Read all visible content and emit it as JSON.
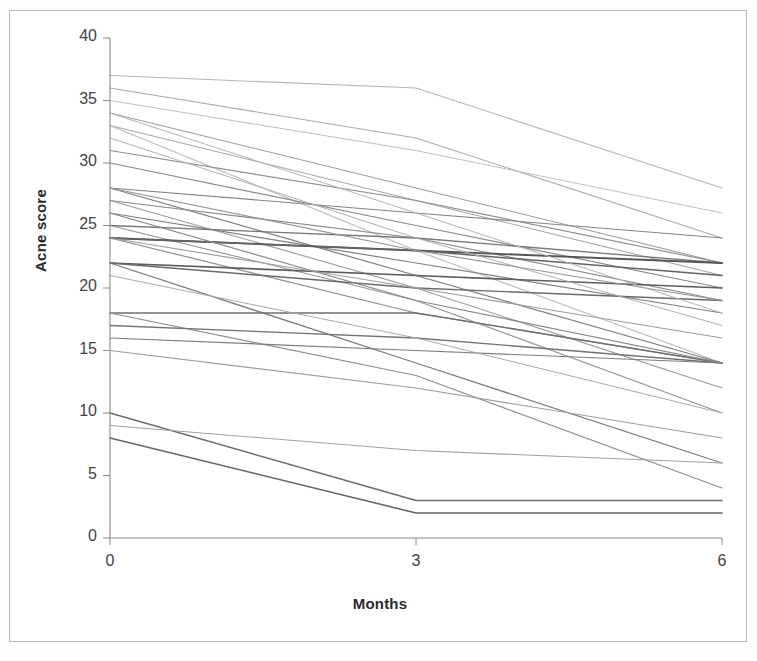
{
  "figure": {
    "background": "#ffffff",
    "frame_color": "#b9b9b9",
    "axis_color": "#8a8a8a"
  },
  "chart_data": {
    "type": "line",
    "title": "",
    "subtitle": "",
    "xlabel": "Months",
    "ylabel": "Acne score",
    "x": [
      0,
      3,
      6
    ],
    "xtick_labels": [
      "0",
      "3",
      "6"
    ],
    "ytick_labels": [
      "0",
      "5",
      "10",
      "15",
      "20",
      "25",
      "30",
      "35",
      "40"
    ],
    "xlim": [
      0,
      6
    ],
    "ylim": [
      0,
      40
    ],
    "ytick_step": 5,
    "grid": false,
    "legend": false,
    "legend_position": "none",
    "annotations": [],
    "line_color": "#6e6e6e",
    "series": [
      {
        "name": "patient-01",
        "values": [
          37,
          36,
          28
        ],
        "color": "#b5b5b5",
        "width": 1.1
      },
      {
        "name": "patient-02",
        "values": [
          36,
          32,
          24
        ],
        "color": "#ababab",
        "width": 1.1
      },
      {
        "name": "patient-03",
        "values": [
          34,
          28,
          22
        ],
        "color": "#9e9e9e",
        "width": 1.1
      },
      {
        "name": "patient-04",
        "values": [
          33,
          27,
          21
        ],
        "color": "#a6a6a6",
        "width": 1.1
      },
      {
        "name": "patient-05",
        "values": [
          33,
          23,
          14
        ],
        "color": "#bcbcbc",
        "width": 1.1
      },
      {
        "name": "patient-06",
        "values": [
          31,
          27,
          22
        ],
        "color": "#8f8f8f",
        "width": 1.2
      },
      {
        "name": "patient-07",
        "values": [
          30,
          25,
          20
        ],
        "color": "#8a8a8a",
        "width": 1.2
      },
      {
        "name": "patient-08",
        "values": [
          28,
          26,
          24
        ],
        "color": "#858585",
        "width": 1.2
      },
      {
        "name": "patient-09",
        "values": [
          28,
          21,
          14
        ],
        "color": "#7d7d7d",
        "width": 1.2
      },
      {
        "name": "patient-10",
        "values": [
          27,
          24,
          19
        ],
        "color": "#8b8b8b",
        "width": 1.2
      },
      {
        "name": "patient-11",
        "values": [
          27,
          20,
          12
        ],
        "color": "#9a9a9a",
        "width": 1.1
      },
      {
        "name": "patient-12",
        "values": [
          26,
          22,
          18
        ],
        "color": "#808080",
        "width": 1.2
      },
      {
        "name": "patient-13",
        "values": [
          25,
          24,
          22
        ],
        "color": "#777777",
        "width": 1.3
      },
      {
        "name": "patient-14",
        "values": [
          25,
          19,
          10
        ],
        "color": "#949494",
        "width": 1.1
      },
      {
        "name": "patient-15",
        "values": [
          24,
          23,
          22
        ],
        "color": "#555555",
        "width": 1.8
      },
      {
        "name": "patient-16",
        "values": [
          24,
          23,
          21
        ],
        "color": "#636363",
        "width": 1.5
      },
      {
        "name": "patient-17",
        "values": [
          24,
          18,
          14
        ],
        "color": "#8d8d8d",
        "width": 1.2
      },
      {
        "name": "patient-18",
        "values": [
          22,
          21,
          20
        ],
        "color": "#5c5c5c",
        "width": 1.7
      },
      {
        "name": "patient-19",
        "values": [
          22,
          20,
          19
        ],
        "color": "#6a6a6a",
        "width": 1.4
      },
      {
        "name": "patient-20",
        "values": [
          22,
          14,
          6
        ],
        "color": "#7a7a7a",
        "width": 1.3
      },
      {
        "name": "patient-21",
        "values": [
          18,
          18,
          14
        ],
        "color": "#6f6f6f",
        "width": 1.4
      },
      {
        "name": "patient-22",
        "values": [
          18,
          13,
          4
        ],
        "color": "#8e8e8e",
        "width": 1.2
      },
      {
        "name": "patient-23",
        "values": [
          17,
          16,
          14
        ],
        "color": "#737373",
        "width": 1.3
      },
      {
        "name": "patient-24",
        "values": [
          16,
          15,
          14
        ],
        "color": "#7c7c7c",
        "width": 1.2
      },
      {
        "name": "patient-25",
        "values": [
          15,
          12,
          8
        ],
        "color": "#9d9d9d",
        "width": 1.1
      },
      {
        "name": "patient-26",
        "values": [
          10,
          3,
          3
        ],
        "color": "#6b6b6b",
        "width": 1.5
      },
      {
        "name": "patient-27",
        "values": [
          9,
          7,
          6
        ],
        "color": "#a0a0a0",
        "width": 1.1
      },
      {
        "name": "patient-28",
        "values": [
          8,
          2,
          2
        ],
        "color": "#666666",
        "width": 1.6
      },
      {
        "name": "patient-29",
        "values": [
          35,
          31,
          26
        ],
        "color": "#c0c0c0",
        "width": 1.0
      },
      {
        "name": "patient-30",
        "values": [
          32,
          24,
          17
        ],
        "color": "#b0b0b0",
        "width": 1.0
      },
      {
        "name": "patient-31",
        "values": [
          28,
          23,
          19
        ],
        "color": "#959595",
        "width": 1.1
      },
      {
        "name": "patient-32",
        "values": [
          26,
          19,
          14
        ],
        "color": "#888888",
        "width": 1.2
      },
      {
        "name": "patient-33",
        "values": [
          24,
          20,
          16
        ],
        "color": "#9c9c9c",
        "width": 1.1
      },
      {
        "name": "patient-34",
        "values": [
          21,
          16,
          10
        ],
        "color": "#a9a9a9",
        "width": 1.0
      },
      {
        "name": "patient-35",
        "values": [
          34,
          26,
          18
        ],
        "color": "#b3b3b3",
        "width": 1.0
      }
    ]
  }
}
